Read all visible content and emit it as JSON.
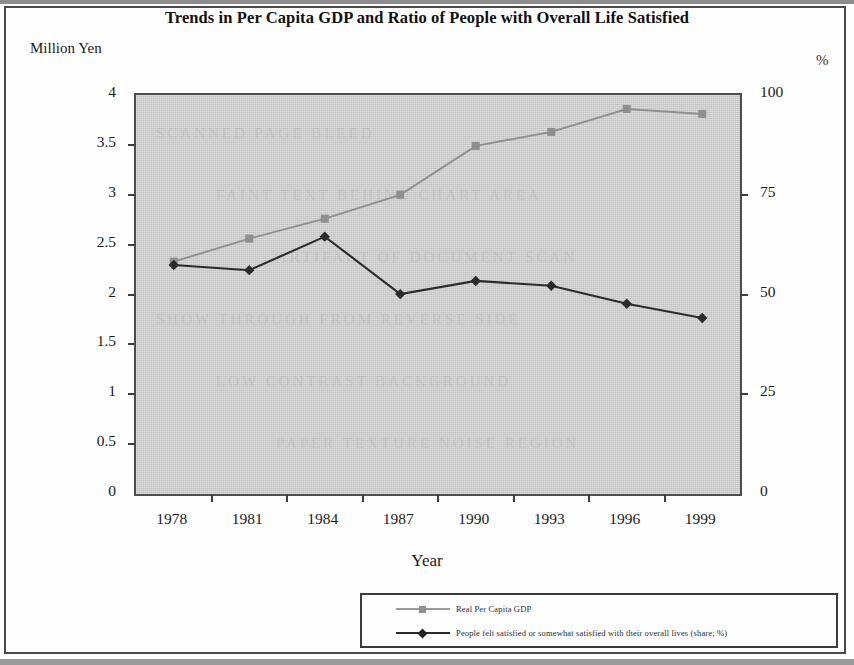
{
  "chart_data": {
    "type": "line",
    "title": "Trends in Per Capita GDP and Ratio of People with Overall Life Satisfied",
    "xlabel": "Year",
    "ylabel": "Million Yen",
    "y2label": "%",
    "categories": [
      "1978",
      "1981",
      "1984",
      "1987",
      "1990",
      "1993",
      "1996",
      "1999"
    ],
    "ylim": [
      0,
      4
    ],
    "y2lim": [
      0,
      100
    ],
    "yticks": [
      "0",
      "0.5",
      "1",
      "1.5",
      "2",
      "2.5",
      "3",
      "3.5",
      "4"
    ],
    "y2ticks": [
      "0",
      "25",
      "50",
      "75",
      "100"
    ],
    "grid": false,
    "legend_position": "bottom-right",
    "series": [
      {
        "name": "Real Per Capita GDP",
        "axis": "left",
        "unit": "Million Yen",
        "color": "#8f8f8f",
        "marker": "square",
        "values": [
          2.33,
          2.56,
          2.76,
          3.0,
          3.49,
          3.63,
          3.86,
          3.81
        ]
      },
      {
        "name": "People felt satisfied or somewhat satisfied with their overall lives (share; %)",
        "axis": "right",
        "unit": "%",
        "color": "#2b2b2b",
        "marker": "diamond",
        "values": [
          57.4,
          56.1,
          64.5,
          50.1,
          53.4,
          52.2,
          47.7,
          44.1
        ]
      }
    ]
  },
  "legend": {
    "items": [
      {
        "label": "Real Per Capita GDP",
        "color": "#8f8f8f",
        "marker": "square"
      },
      {
        "label": "People felt satisfied or somewhat satisfied with their overall lives (share; %)",
        "color": "#2b2b2b",
        "marker": "diamond"
      }
    ]
  },
  "ghost_text": {
    "lines": [
      "SCANNED PAGE BLEED",
      "FAINT TEXT BEHIND CHART AREA",
      "ARTIFACT OF DOCUMENT SCAN",
      "SHOW THROUGH FROM REVERSE SIDE",
      "LOW CONTRAST BACKGROUND",
      "PAPER TEXTURE NOISE REGION"
    ]
  }
}
